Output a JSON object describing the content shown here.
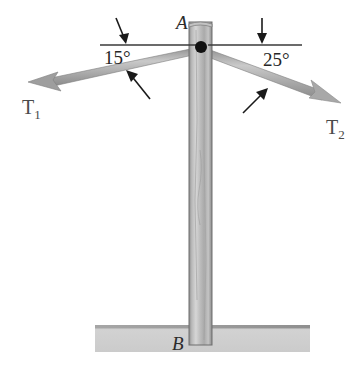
{
  "figure": {
    "background_color": "#ffffff"
  },
  "points": {
    "top_label": "A",
    "base_label": "B"
  },
  "angles": {
    "left": "15°",
    "right": "25°"
  },
  "forces": {
    "left": {
      "symbol": "T",
      "subscript": "1"
    },
    "right": {
      "symbol": "T",
      "subscript": "2"
    }
  },
  "colors": {
    "pole": "#a8a8a8",
    "pole_edge": "#6e6e6e",
    "cable": "#9a9a9a",
    "ground": "#cfcfcf",
    "ground_edge": "#9d9d9d",
    "reference_line": "#3a3a3a",
    "pointer_arrow": "#1a1a1a",
    "joint_dot": "#111111",
    "text": "#2b2b2b"
  },
  "icons": {
    "pointer_upper_left": "down-left-pointer-icon",
    "pointer_lower_left": "up-left-pointer-icon",
    "pointer_upper_right": "down-pointer-icon",
    "pointer_lower_right": "up-right-pointer-icon",
    "joint": "joint-dot-icon"
  },
  "geometry": {
    "joint": {
      "x": 201,
      "y": 47
    },
    "pole": {
      "left": 189,
      "right": 212,
      "top": 22,
      "bottom": 345
    },
    "ground": {
      "left": 95,
      "right": 310,
      "top": 325,
      "bottom": 352
    },
    "reference_line_left": {
      "x1": 100,
      "x2": 196,
      "y": 45
    },
    "reference_line_right": {
      "x1": 208,
      "x2": 302,
      "y": 45
    },
    "cable_left_tip": {
      "x": 28,
      "y": 82
    },
    "cable_right_tip": {
      "x": 341,
      "y": 103
    }
  }
}
